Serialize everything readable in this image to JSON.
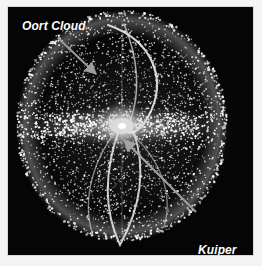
{
  "figure": {
    "kind": "astronomy-illustration",
    "background_color": "#050505",
    "margin_color": "#f4f4f2",
    "particle_color": "#ffffff",
    "annotation_color": "#9a9a9a"
  },
  "annotations": [
    {
      "id": "oort-cloud",
      "label": "Oort Cloud",
      "lines": [
        "Oort Cloud"
      ],
      "text_color": "#ffffff",
      "arrow_color": "#9a9a9a",
      "arrow": {
        "from_x": 58,
        "from_y": 38,
        "to_x": 96,
        "to_y": 74
      }
    },
    {
      "id": "kuiper-belt",
      "label": "Kuiper Belt",
      "lines": [
        "Kuiper",
        "Belt"
      ],
      "text_color": "#ffffff",
      "arrow_color": "#9a9a9a",
      "arrow": {
        "from_x": 196,
        "from_y": 212,
        "to_x": 124,
        "to_y": 140
      }
    }
  ],
  "structures": {
    "oort_shell": {
      "name": "Oort Cloud spherical shell",
      "center_x": 122,
      "center_y": 126,
      "radius_x": 105,
      "radius_y": 115,
      "rim_highlight": true
    },
    "central_disk": {
      "name": "inner solar system bright core",
      "center_x": 122,
      "center_y": 126,
      "radius": 16,
      "color": "#e8e8e8"
    },
    "equatorial_band": {
      "name": "Kuiper Belt / ecliptic plane bright band",
      "center_y": 126,
      "half_height": 16
    },
    "orbit_loops": {
      "name": "long-period comet orbit loops",
      "count": 3
    }
  },
  "chart_data": {
    "type": "scatter",
    "title": "Oort Cloud",
    "xlabel": "",
    "ylabel": "",
    "projection": "3D spherical shell, point cloud",
    "point_count_approx": 2600,
    "annotations": [
      "Oort Cloud",
      "Kuiper Belt"
    ],
    "legend_position": "none",
    "grid": false
  }
}
